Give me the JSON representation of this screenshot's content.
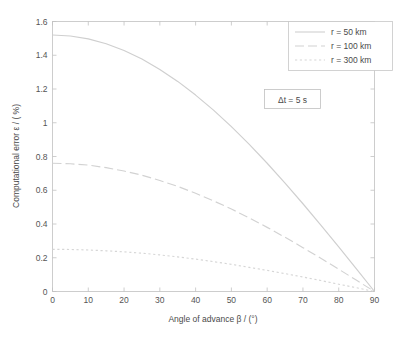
{
  "chart_data": {
    "type": "line",
    "title": "",
    "xlabel": "Angle of advance    β / (°)",
    "ylabel": "Computational error   ε / (  %)",
    "xlim": [
      0,
      90
    ],
    "ylim": [
      0,
      1.6
    ],
    "xticks": [
      "0",
      "10",
      "20",
      "30",
      "40",
      "50",
      "60",
      "70",
      "80",
      "90"
    ],
    "xtick_values": [
      0,
      10,
      20,
      30,
      40,
      50,
      60,
      70,
      80,
      90
    ],
    "yticks": [
      "0",
      "0.2",
      "0.4",
      "0.6",
      "0.8",
      "1",
      "1.2",
      "1.4",
      "1.6"
    ],
    "ytick_values": [
      0,
      0.2,
      0.4,
      0.6,
      0.8,
      1,
      1.2,
      1.4,
      1.6
    ],
    "grid": false,
    "legend_position": "top-right",
    "x": [
      0,
      5,
      10,
      15,
      20,
      25,
      30,
      35,
      40,
      45,
      50,
      55,
      60,
      65,
      70,
      75,
      80,
      85,
      90
    ],
    "series": [
      {
        "name": "r = 50 km",
        "style": "solid",
        "color": "#cfcfcf",
        "values": [
          1.52,
          1.514,
          1.497,
          1.468,
          1.428,
          1.378,
          1.316,
          1.245,
          1.164,
          1.075,
          0.977,
          0.872,
          0.76,
          0.642,
          0.52,
          0.393,
          0.264,
          0.132,
          0.0
        ]
      },
      {
        "name": "r = 100 km",
        "style": "dashed",
        "color": "#d2d2d2",
        "values": [
          0.76,
          0.757,
          0.749,
          0.734,
          0.714,
          0.689,
          0.658,
          0.623,
          0.582,
          0.537,
          0.489,
          0.436,
          0.38,
          0.321,
          0.26,
          0.197,
          0.132,
          0.066,
          0.0
        ]
      },
      {
        "name": "r = 300 km",
        "style": "dotted",
        "color": "#d6d6d6",
        "values": [
          0.25,
          0.249,
          0.246,
          0.241,
          0.235,
          0.227,
          0.217,
          0.205,
          0.192,
          0.177,
          0.161,
          0.143,
          0.125,
          0.106,
          0.086,
          0.065,
          0.043,
          0.022,
          0.0
        ]
      }
    ],
    "annotations": [
      {
        "text": "Δt = 5 s",
        "x": 47,
        "y": 1.12
      }
    ]
  },
  "legend": {
    "items": [
      {
        "label": "r = 50 km"
      },
      {
        "label": "r = 100 km"
      },
      {
        "label": "r = 300 km"
      }
    ]
  },
  "annotation": {
    "delta_t": "Δt = 5 s"
  },
  "axes": {
    "x_title": "Angle of advance    β / (°)",
    "y_title": "Computational error   ε / (  %)"
  }
}
